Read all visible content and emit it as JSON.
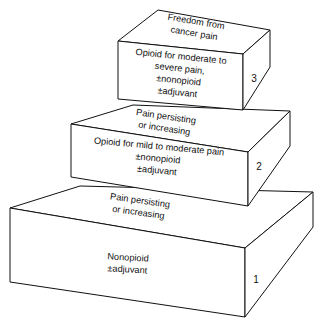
{
  "figure": {
    "name": "WHO three-step analgesic ladder",
    "type": "stepped-block-diagram",
    "steps": 3,
    "line_color": "#111111",
    "face_color": "#ffffff",
    "background_color": "#ffffff"
  },
  "steps": [
    {
      "number": "1",
      "front_lines": [
        "Nonopioid",
        "±adjuvant"
      ],
      "top_lines": [
        "Pain persisting",
        "or increasing"
      ]
    },
    {
      "number": "2",
      "front_lines": [
        "Opioid for mild to moderate pain",
        "±nonopioid",
        "±adjuvant"
      ],
      "top_lines": [
        "Pain persisting",
        "or increasing"
      ]
    },
    {
      "number": "3",
      "front_lines": [
        "Opioid for moderate to",
        "severe pain,",
        "±nonopioid",
        "±adjuvant"
      ],
      "top_lines": [
        "Freedom from",
        "cancer pain"
      ]
    }
  ]
}
